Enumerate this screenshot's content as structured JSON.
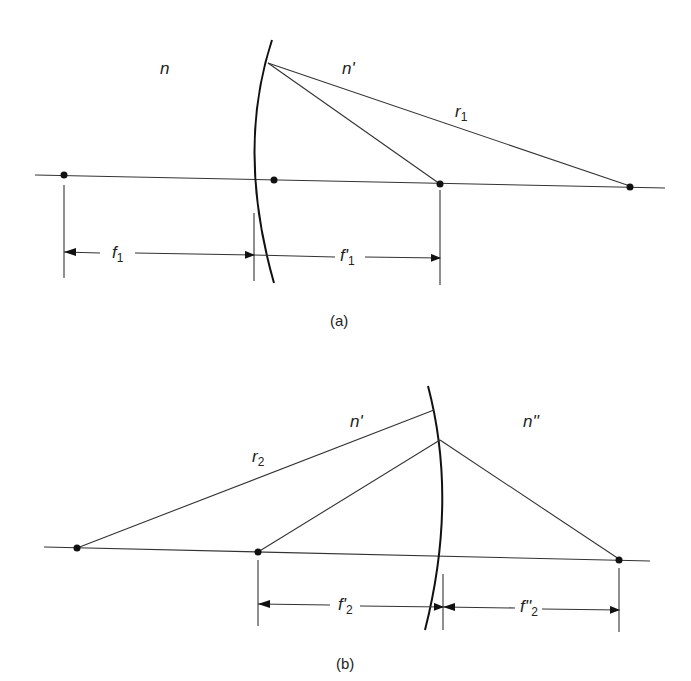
{
  "diagram_a": {
    "caption": "(a)",
    "labels": {
      "n_left": "n",
      "n_right": "n'",
      "radius": "r",
      "radius_sub": "1",
      "f_left": "f",
      "f_left_sub": "1",
      "f_right": "f'",
      "f_right_sub": "1"
    }
  },
  "diagram_b": {
    "caption": "(b)",
    "labels": {
      "n_left": "n'",
      "n_right": "n''",
      "radius": "r",
      "radius_sub": "2",
      "f_left": "f'",
      "f_left_sub": "2",
      "f_right": "f''",
      "f_right_sub": "2"
    }
  }
}
